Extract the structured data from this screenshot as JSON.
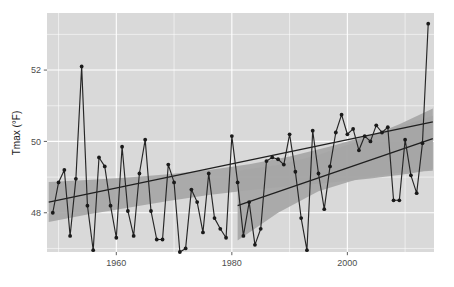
{
  "chart_data": {
    "type": "line",
    "title": "",
    "subtitle": "",
    "xlabel": "",
    "ylabel": "Tmax (°F)",
    "xlim": [
      1948,
      2015
    ],
    "ylim": [
      46.9,
      53.6
    ],
    "grid": true,
    "legend_position": "none",
    "x_ticks": [
      1960,
      1980,
      2000
    ],
    "x_tick_labels": [
      "1960",
      "1980",
      "2000"
    ],
    "y_ticks": [
      48,
      50,
      52
    ],
    "y_tick_labels": [
      "48",
      "50",
      "52"
    ],
    "x_minor_ticks": [
      1950,
      1970,
      1990,
      2010
    ],
    "y_minor_ticks": [
      47,
      49,
      51,
      53
    ],
    "series": [
      {
        "name": "Annual mean Tmax",
        "type": "line-with-points",
        "color": "#262626",
        "x": [
          1949,
          1950,
          1951,
          1952,
          1953,
          1954,
          1955,
          1956,
          1957,
          1958,
          1959,
          1960,
          1961,
          1962,
          1963,
          1964,
          1965,
          1966,
          1967,
          1968,
          1969,
          1970,
          1971,
          1972,
          1973,
          1974,
          1975,
          1976,
          1977,
          1978,
          1979,
          1980,
          1981,
          1982,
          1983,
          1984,
          1985,
          1986,
          1987,
          1988,
          1989,
          1990,
          1991,
          1992,
          1993,
          1994,
          1995,
          1996,
          1997,
          1998,
          1999,
          2000,
          2001,
          2002,
          2003,
          2004,
          2005,
          2006,
          2007,
          2008,
          2009,
          2010,
          2011,
          2012,
          2013,
          2014
        ],
        "y": [
          48.0,
          48.85,
          49.2,
          47.35,
          48.95,
          52.1,
          48.2,
          46.95,
          49.55,
          49.3,
          48.2,
          47.3,
          49.85,
          48.05,
          47.35,
          49.1,
          50.05,
          48.05,
          47.25,
          47.25,
          49.35,
          48.85,
          46.9,
          47.0,
          48.65,
          48.3,
          47.45,
          49.1,
          47.85,
          47.55,
          47.3,
          50.15,
          48.85,
          47.35,
          48.3,
          47.1,
          47.55,
          49.45,
          49.55,
          49.5,
          49.35,
          50.2,
          49.15,
          47.85,
          46.95,
          50.3,
          49.1,
          48.1,
          49.3,
          50.25,
          50.75,
          50.2,
          50.35,
          49.75,
          50.15,
          50.0,
          50.45,
          50.25,
          50.4,
          48.35,
          48.35,
          50.05,
          49.05,
          48.55,
          49.95,
          53.3
        ]
      }
    ],
    "trend_lines": [
      {
        "name": "full-period-trend",
        "x": [
          1948.3,
          2014.8
        ],
        "y": [
          48.3,
          50.55
        ],
        "color": "#1f1f1f"
      },
      {
        "name": "recent-period-trend",
        "x": [
          1981.0,
          2014.8
        ],
        "y": [
          48.2,
          50.08
        ],
        "color": "#1f1f1f"
      }
    ],
    "confidence_band": {
      "name": "full-period-confidence-interval",
      "color": "#a6a6a6",
      "x": [
        1948.3,
        1955,
        1962,
        1969,
        1976,
        1983,
        1990,
        1997,
        2004,
        2011,
        2014.8
      ],
      "y_low": [
        47.74,
        47.95,
        48.14,
        48.33,
        48.5,
        48.63,
        48.74,
        48.84,
        48.96,
        49.1,
        49.22
      ],
      "y_high": [
        48.86,
        48.92,
        48.99,
        49.08,
        49.2,
        49.36,
        49.58,
        49.86,
        50.18,
        50.52,
        50.72
      ]
    },
    "recent_confidence_band": {
      "name": "recent-period-confidence-interval",
      "color": "#a6a6a6",
      "x": [
        1981.0,
        1988,
        1995,
        2002,
        2009,
        2014.8
      ],
      "y_low": [
        47.22,
        48.0,
        48.6,
        48.95,
        49.12,
        49.18
      ],
      "y_high": [
        49.18,
        49.34,
        49.62,
        50.02,
        50.48,
        50.92
      ]
    }
  },
  "axes": {
    "y_axis_title": "Tmax (°F)"
  }
}
